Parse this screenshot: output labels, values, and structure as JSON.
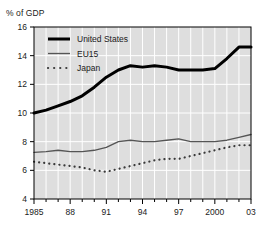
{
  "chart_data": {
    "type": "line",
    "title": "",
    "ylabel": "% of GDP",
    "xlabel": "",
    "ylim": [
      4,
      16
    ],
    "yticks": [
      4,
      6,
      8,
      10,
      12,
      14,
      16
    ],
    "ytick_labels": [
      "4",
      "6",
      "8",
      "10",
      "12",
      "14",
      "16"
    ],
    "xlim": [
      1985,
      2003
    ],
    "xticks": [
      1985,
      1988,
      1991,
      1994,
      1997,
      2000,
      2003
    ],
    "xtick_labels": [
      "1985",
      "88",
      "91",
      "94",
      "97",
      "2000",
      "03"
    ],
    "grid": true,
    "grid_color": "#ffffff",
    "plot_background": "#dedede",
    "legend_position": "top-left",
    "x": [
      1985,
      1986,
      1987,
      1988,
      1989,
      1990,
      1991,
      1992,
      1993,
      1994,
      1995,
      1996,
      1997,
      1998,
      1999,
      2000,
      2001,
      2002,
      2003
    ],
    "series": [
      {
        "name": "United States",
        "style": "thick-solid",
        "color": "#000000",
        "values": [
          10.0,
          10.2,
          10.5,
          10.8,
          11.2,
          11.8,
          12.5,
          13.0,
          13.3,
          13.2,
          13.3,
          13.2,
          13.0,
          13.0,
          13.0,
          13.1,
          13.8,
          14.6,
          14.6
        ]
      },
      {
        "name": "EU15",
        "style": "thin-solid",
        "color": "#555555",
        "values": [
          7.25,
          7.3,
          7.4,
          7.3,
          7.3,
          7.4,
          7.6,
          8.0,
          8.1,
          8.0,
          8.0,
          8.1,
          8.2,
          8.0,
          8.0,
          8.0,
          8.1,
          8.3,
          8.5
        ]
      },
      {
        "name": "Japan",
        "style": "dotted",
        "color": "#3a3a3a",
        "values": [
          6.6,
          6.5,
          6.4,
          6.3,
          6.2,
          6.0,
          5.9,
          6.1,
          6.3,
          6.5,
          6.7,
          6.8,
          6.8,
          7.0,
          7.2,
          7.4,
          7.6,
          7.75,
          7.75
        ]
      }
    ]
  },
  "legend": {
    "items": [
      {
        "label": "United States",
        "swatch": "thick-solid"
      },
      {
        "label": "EU15",
        "swatch": "thin-solid"
      },
      {
        "label": "Japan",
        "swatch": "dotted"
      }
    ]
  }
}
